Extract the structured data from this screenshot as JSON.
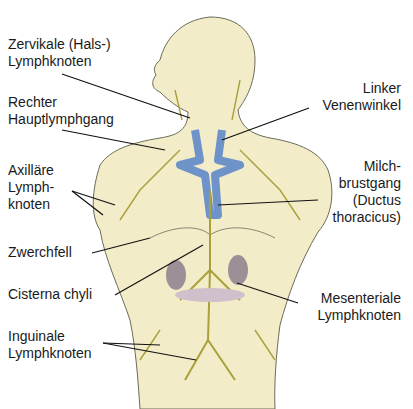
{
  "diagram": {
    "colors": {
      "skin": "#f3ecc8",
      "outline": "#6b6b5a",
      "lymph": "#a8a03a",
      "vein": "#6e93c8",
      "organ": "#9c8f96",
      "gut": "#cfc0cc",
      "leader": "#111111"
    },
    "labels": {
      "zervikale": "Zervikale (Hals-)\nLymphknoten",
      "rechter": "Rechter\nHauptlymphgang",
      "axillaere": "Axilläre\nLymph-\nknoten",
      "zwerchfell": "Zwerchfell",
      "cisterna": "Cisterna chyli",
      "inguinale": "Inguinale\nLymphknoten",
      "linker": "Linker\nVenenwinkel",
      "milch": "Milch-\nbrustgang\n(Ductus\nthoracicus)",
      "mesenteriale": "Mesenteriale\nLymphknoten"
    }
  }
}
